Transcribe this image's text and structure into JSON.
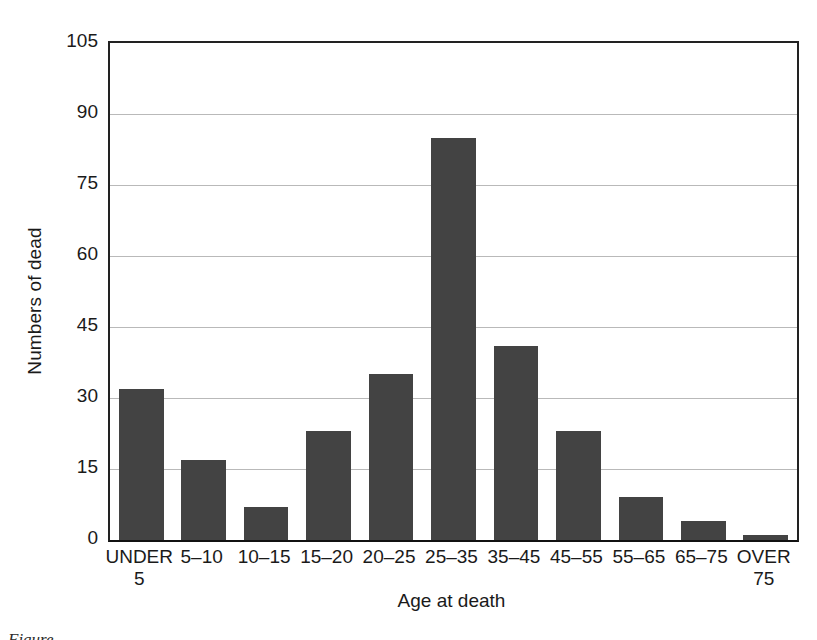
{
  "chart_data": {
    "type": "bar",
    "title": "",
    "xlabel": "Age at death",
    "ylabel": "Numbers of dead",
    "categories": [
      "UNDER 5",
      "5–10",
      "10–15",
      "15–20",
      "20–25",
      "25–35",
      "35–45",
      "45–55",
      "55–65",
      "65–75",
      "OVER 75"
    ],
    "category_lines": [
      [
        "UNDER",
        "5"
      ],
      [
        "5–10",
        ""
      ],
      [
        "10–15",
        ""
      ],
      [
        "15–20",
        ""
      ],
      [
        "20–25",
        ""
      ],
      [
        "25–35",
        ""
      ],
      [
        "35–45",
        ""
      ],
      [
        "45–55",
        ""
      ],
      [
        "55–65",
        ""
      ],
      [
        "65–75",
        ""
      ],
      [
        "OVER",
        "75"
      ]
    ],
    "values": [
      32,
      17,
      7,
      23,
      35,
      85,
      41,
      23,
      9,
      4,
      1
    ],
    "ylim": [
      0,
      105
    ],
    "yticks": [
      0,
      15,
      30,
      45,
      60,
      75,
      90,
      105
    ],
    "ytick_labels": [
      "0",
      "15",
      "30",
      "45",
      "60",
      "75",
      "90",
      "105"
    ],
    "grid": "horizontal",
    "legend": "none",
    "bar_color": "#434343",
    "axis_color": "#222222",
    "grid_color": "#b9b9b9"
  },
  "caption": {
    "text": "Figure"
  }
}
